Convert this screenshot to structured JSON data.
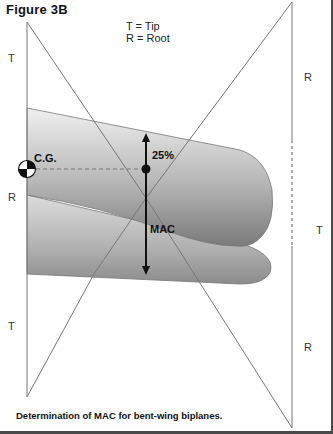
{
  "figure": {
    "title": "Figure 3B",
    "legend": {
      "tip": "T = Tip",
      "root": "R = Root"
    },
    "side_labels": {
      "left_top": "T",
      "left_middle": "R",
      "left_bottom": "T",
      "right_top": "R",
      "right_middle": "T",
      "right_bottom": "R"
    },
    "annotations": {
      "cg": "C.G.",
      "quarter_chord": "25%",
      "mac": "MAC"
    },
    "caption": "Determination of MAC for bent-wing biplanes.",
    "colors": {
      "line": "#777777",
      "wing_light": "#e8e8e8",
      "wing_dark": "#8a8a8a",
      "arrow": "#111111",
      "frame": "#4a4a4a"
    }
  }
}
